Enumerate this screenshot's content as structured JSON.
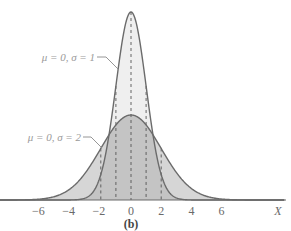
{
  "chart_data": {
    "type": "area",
    "title": "",
    "caption": "(b)",
    "xlabel": "X",
    "ylabel": "",
    "xlim": [
      -7.5,
      10
    ],
    "x_ticks": [
      -6,
      -4,
      -2,
      0,
      2,
      4,
      6
    ],
    "x_tick_labels": [
      "−6",
      "−4",
      "−2",
      "0",
      "2",
      "4",
      "6"
    ],
    "grid": false,
    "legend": "inline leader-line labels",
    "series": [
      {
        "name": "μ = 0, σ = 1",
        "mu": 0,
        "sigma": 1,
        "peak_density": 0.399,
        "fill": "#efefef",
        "stroke": "#6b6b6b",
        "dashed_markers_at": [
          -1,
          0,
          1
        ]
      },
      {
        "name": "μ = 0, σ = 2",
        "mu": 0,
        "sigma": 2,
        "peak_density": 0.199,
        "fill": "#d6d6d6",
        "stroke": "#6b6b6b",
        "dashed_markers_at": [
          -2,
          2
        ]
      }
    ],
    "overlap_fill": "#c4c4c4"
  },
  "labels": {
    "sigma1": "μ = 0, σ = 1",
    "sigma2": "μ = 0, σ = 2",
    "axis_x": "X",
    "caption": "(b)",
    "ticks": [
      "−6",
      "−4",
      "−2",
      "0",
      "2",
      "4",
      "6"
    ]
  }
}
